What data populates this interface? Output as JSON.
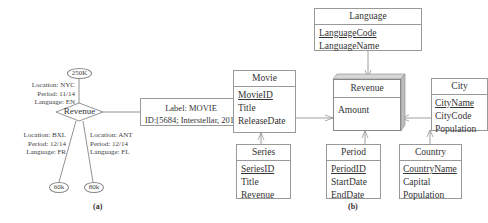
{
  "panel_a": {
    "caption": "(a)",
    "center_node": "Revenue",
    "values": [
      {
        "value": "250K",
        "attrs": [
          "Location: NYC",
          "Period: 11/14",
          "Language: EN"
        ]
      },
      {
        "value": "60k",
        "attrs": [
          "Location: BXL",
          "Period: 12/14",
          "Language: FR"
        ]
      },
      {
        "value": "80k",
        "attrs": [
          "Location: ANT",
          "Period: 12/14",
          "Language: FL"
        ]
      }
    ],
    "label_box": {
      "line1": "Label: MOVIE",
      "line2": "ID:[5684; Interstellar, 2014]"
    }
  },
  "panel_b": {
    "caption": "(b)",
    "fact": {
      "name": "Revenue",
      "attrs": [
        "Amount"
      ]
    },
    "entities": {
      "language": {
        "name": "Language",
        "key": "LanguageCode",
        "attrs": [
          "LanguageName"
        ]
      },
      "movie": {
        "name": "Movie",
        "key": "MovieID",
        "attrs": [
          "Title",
          "ReleaseDate"
        ]
      },
      "series": {
        "name": "Series",
        "key": "SeriesID",
        "attrs": [
          "Title",
          "Revenue"
        ]
      },
      "period": {
        "name": "Period",
        "key": "PeriodID",
        "attrs": [
          "StartDate",
          "EndDate"
        ]
      },
      "city": {
        "name": "City",
        "key": "CityName",
        "attrs": [
          "CityCode",
          "Population"
        ]
      },
      "country": {
        "name": "Country",
        "key": "CountryName",
        "attrs": [
          "Capital",
          "Population"
        ]
      }
    }
  }
}
